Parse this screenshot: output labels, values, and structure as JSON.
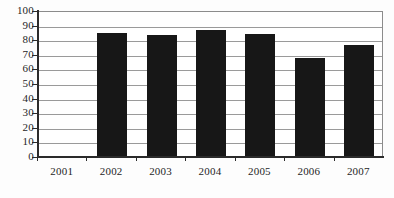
{
  "chart_data": {
    "type": "bar",
    "title": "",
    "subtitle": "",
    "xlabel": "",
    "ylabel": "",
    "categories": [
      "2001",
      "2002",
      "2003",
      "2004",
      "2005",
      "2006",
      "2007"
    ],
    "values": [
      null,
      84,
      83,
      86.5,
      83.5,
      67,
      76
    ],
    "series": [
      {
        "name": "",
        "values": [
          null,
          84,
          83,
          86.5,
          83.5,
          67,
          76
        ]
      }
    ],
    "ylim": [
      0,
      100
    ],
    "ytick_labels": [
      "0",
      "10",
      "20",
      "30",
      "40",
      "50",
      "60",
      "70",
      "80",
      "90",
      "100"
    ],
    "ytick_values": [
      0,
      10,
      20,
      30,
      40,
      50,
      60,
      70,
      80,
      90,
      100
    ],
    "xtick_labels": [
      "2001",
      "2002",
      "2003",
      "2004",
      "2005",
      "2006",
      "2007"
    ],
    "grid": true,
    "grid_axis": "y",
    "legend": false,
    "legend_position": "none",
    "bar_color": "#171717",
    "grid_color": "#9a9a9a",
    "axis_color": "#2b2b2b",
    "background_color": "#ffffff",
    "annotations": []
  }
}
